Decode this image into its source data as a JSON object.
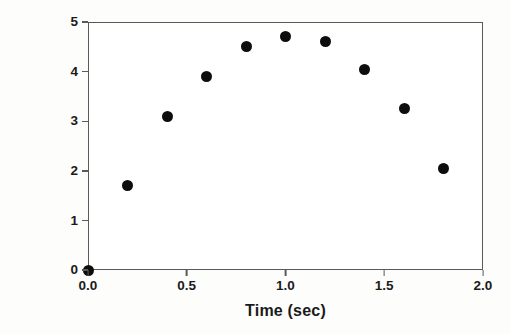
{
  "chart_data": {
    "type": "scatter",
    "title": "",
    "xlabel": "Time (sec)",
    "ylabel": "Height (m)",
    "xlim": [
      0.0,
      2.0
    ],
    "ylim": [
      0,
      5
    ],
    "grid": false,
    "legend": null,
    "marker": {
      "shape": "circle",
      "color": "#0d0d0d",
      "size_px": 11
    },
    "axis_color": "#5a5a5a",
    "background": "#ffffff",
    "x_ticks": [
      "0.0",
      "0.5",
      "1.0",
      "1.5",
      "2.0"
    ],
    "x_tick_values": [
      0.0,
      0.5,
      1.0,
      1.5,
      2.0
    ],
    "y_ticks": [
      "0",
      "1",
      "2",
      "3",
      "4",
      "5"
    ],
    "y_tick_values": [
      0,
      1,
      2,
      3,
      4,
      5
    ],
    "x": [
      0.0,
      0.2,
      0.4,
      0.6,
      0.8,
      1.0,
      1.2,
      1.4,
      1.6,
      1.8
    ],
    "y": [
      0.0,
      1.7,
      3.1,
      3.9,
      4.5,
      4.7,
      4.6,
      4.05,
      3.25,
      2.05
    ],
    "points": [
      {
        "x": 0.0,
        "y": 0.0
      },
      {
        "x": 0.2,
        "y": 1.7
      },
      {
        "x": 0.4,
        "y": 3.1
      },
      {
        "x": 0.6,
        "y": 3.9
      },
      {
        "x": 0.8,
        "y": 4.5
      },
      {
        "x": 1.0,
        "y": 4.7
      },
      {
        "x": 1.2,
        "y": 4.6
      },
      {
        "x": 1.4,
        "y": 4.05
      },
      {
        "x": 1.6,
        "y": 3.25
      },
      {
        "x": 1.8,
        "y": 2.05
      }
    ]
  }
}
